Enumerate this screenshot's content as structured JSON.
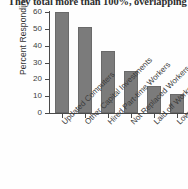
{
  "caption": {
    "text": "They total more than 100%, overlapping"
  },
  "chart_data": {
    "type": "bar",
    "title": "",
    "xlabel": "",
    "ylabel": "Percent Responding",
    "categories": [
      "Updated Computers",
      "Other Capital Investments",
      "Hired Part-time Workers",
      "Not Replaced Workers",
      "Laid off Workers",
      "Lowered Salaries"
    ],
    "values": [
      60,
      51,
      37,
      25,
      16,
      11
    ],
    "ylim": [
      0,
      60
    ],
    "yticks": [
      0,
      10,
      20,
      30,
      40,
      50,
      60
    ],
    "ytick_labels": [
      "0",
      "10",
      "20",
      "30",
      "40",
      "50",
      "60"
    ],
    "grid": false,
    "legend": null,
    "bar_color": "#7b7b7b",
    "axis_color": "#4a4a4a"
  }
}
